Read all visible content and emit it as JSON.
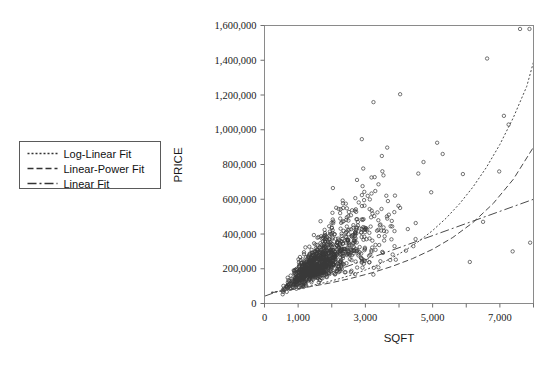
{
  "chart_data": {
    "type": "scatter",
    "title": "",
    "xlabel": "SQFT",
    "ylabel": "PRICE",
    "xlim": [
      0,
      8000
    ],
    "ylim": [
      0,
      1600000
    ],
    "grid": false,
    "legend_position": "left-outside",
    "x_ticks_major": [
      0,
      1000,
      3000,
      5000,
      7000
    ],
    "x_ticks_minor": [
      2000,
      4000,
      6000,
      8000
    ],
    "x_tick_labels": [
      "0",
      "1,000",
      "3,000",
      "5,000",
      "7,000"
    ],
    "y_ticks": [
      0,
      200000,
      400000,
      600000,
      800000,
      1000000,
      1200000,
      1400000,
      1600000
    ],
    "y_tick_labels": [
      "0",
      "200,000",
      "400,000",
      "600,000",
      "800,000",
      "1,000,000",
      "1,200,000",
      "1,400,000",
      "1,600,000"
    ],
    "marker": "open-circle",
    "marker_size": 3,
    "point_color": "#3a3a3a",
    "series": [
      {
        "name": "Log-Linear Fit",
        "type": "line",
        "dash": "2,2",
        "model": "exponential",
        "description": "PRICE = 60000 * exp(0.00039 * SQFT)",
        "points": [
          [
            200,
            64800
          ],
          [
            600,
            75700
          ],
          [
            1000,
            88500
          ],
          [
            1400,
            103400
          ],
          [
            1800,
            120800
          ],
          [
            2200,
            141200
          ],
          [
            2600,
            165000
          ],
          [
            3000,
            192800
          ],
          [
            3400,
            225300
          ],
          [
            3800,
            263300
          ],
          [
            4200,
            307700
          ],
          [
            4600,
            359500
          ],
          [
            5000,
            420100
          ],
          [
            5400,
            490900
          ],
          [
            5800,
            573700
          ],
          [
            6200,
            670400
          ],
          [
            6600,
            783400
          ],
          [
            7000,
            915400
          ],
          [
            7400,
            1069700
          ],
          [
            7800,
            1250000
          ],
          [
            8000,
            1390000
          ]
        ]
      },
      {
        "name": "Linear-Power Fit",
        "type": "line",
        "dash": "6,3",
        "model": "power",
        "description": "PRICE = 280 * SQFT^0.92 (approx)",
        "points": [
          [
            200,
            62000
          ],
          [
            800,
            79000
          ],
          [
            1400,
            98000
          ],
          [
            2000,
            120000
          ],
          [
            2600,
            146000
          ],
          [
            3200,
            177000
          ],
          [
            3800,
            214000
          ],
          [
            4400,
            258000
          ],
          [
            5000,
            312000
          ],
          [
            5600,
            380000
          ],
          [
            6200,
            466000
          ],
          [
            6800,
            575000
          ],
          [
            7400,
            715000
          ],
          [
            8000,
            900000
          ]
        ]
      },
      {
        "name": "Linear Fit",
        "type": "line",
        "dash": "9,3,2,3",
        "model": "linear",
        "description": "PRICE = 40000 + 70 * SQFT (approx)",
        "points": [
          [
            0,
            42000
          ],
          [
            8000,
            600000
          ]
        ]
      }
    ],
    "scatter_note": "Dense cluster of residential sales between 800-3200 sqft and 60,000-280,000 price; fan-shaped heteroscedastic spread widening with SQFT; several high-price outliers near 1,580,000 at ~7,600-7,900 sqft and ~1,410,000 at ~6,600 sqft."
  },
  "legend": {
    "items": [
      {
        "label": "Log-Linear Fit",
        "style": "fine-dashed"
      },
      {
        "label": "Linear-Power Fit",
        "style": "long-dashed"
      },
      {
        "label": "Linear Fit",
        "style": "dash-dot"
      }
    ]
  },
  "axes": {
    "x_title": "SQFT",
    "y_title": "PRICE"
  }
}
